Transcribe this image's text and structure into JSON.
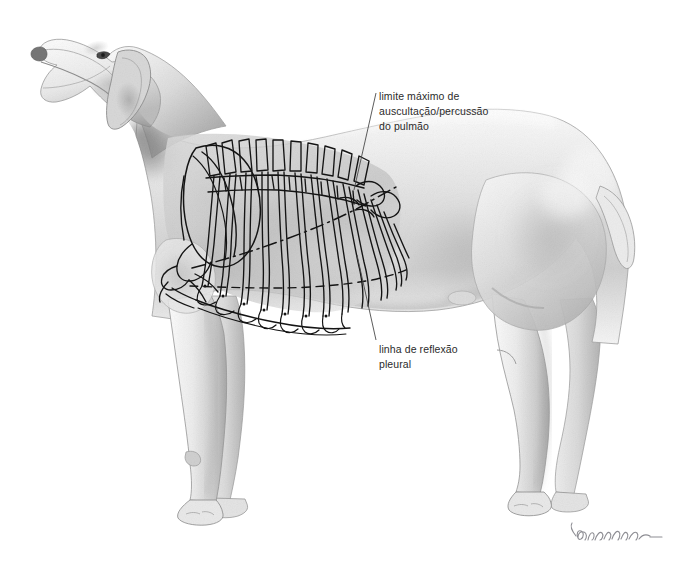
{
  "figure": {
    "kind": "anatomical-illustration",
    "medium": "graphite-pencil-drawing",
    "background_color": "#ffffff",
    "width": 692,
    "height": 561
  },
  "annotations": [
    {
      "id": "auscultation-limit",
      "name": "limite-maximo-auscultacao-percussao-label",
      "lines": [
        "limite máximo de",
        "auscultação/percussão",
        "do pulmão"
      ],
      "text_color": "#2b2b2b",
      "leader": {
        "from_x": 376,
        "from_y": 93,
        "to_x": 354,
        "to_y": 190
      }
    },
    {
      "id": "pleural-reflection-line",
      "name": "linha-reflexao-pleural-label",
      "lines": [
        "linha de reflexão",
        "pleural"
      ],
      "text_color": "#2b2b2b",
      "leader": {
        "from_x": 376,
        "from_y": 340,
        "to_x": 357,
        "to_y": 255
      }
    }
  ],
  "signature": {
    "name": "artist-signature",
    "present": true,
    "color": "#8d8d93"
  },
  "palette": {
    "ink": "#1a1a1a",
    "bone_outline": "#111111",
    "fur_light": "#f2f2f2",
    "fur_mid": "#cfcfcf",
    "fur_dark": "#8e8e8e",
    "fur_shadow": "#5c5c5c",
    "leader_line": "#4a4a4a",
    "text": "#2b2b2b"
  }
}
